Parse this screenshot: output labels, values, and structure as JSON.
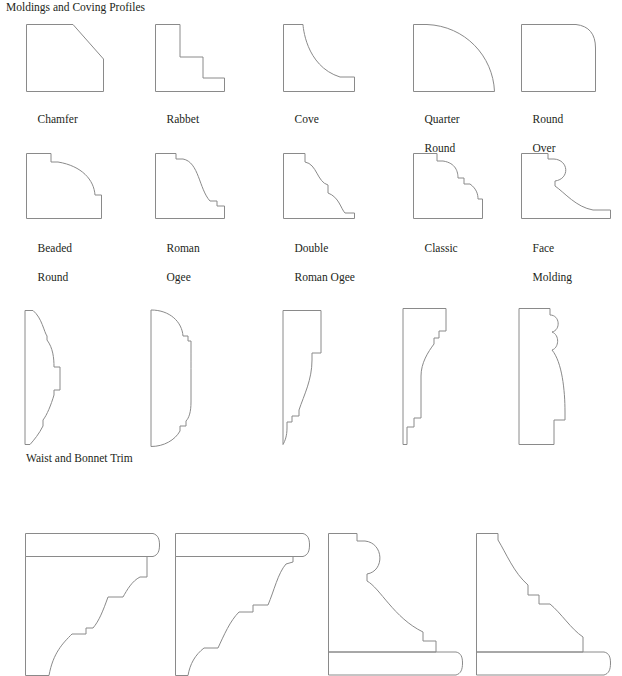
{
  "document": {
    "headings": [
      {
        "id": "title-main",
        "text": "Moldings and Coving Profiles"
      },
      {
        "id": "title-waist",
        "text": "Waist and Bonnet Trim"
      }
    ],
    "stroke_color": "#8a8a8a",
    "text_color": "#231f20",
    "background_color": "#ffffff"
  },
  "rows": {
    "row1": {
      "name": "molding-profiles-row-1",
      "items": [
        {
          "label_line1": "Chamfer",
          "label_line2": "",
          "shape": "chamfer"
        },
        {
          "label_line1": "Rabbet",
          "label_line2": "",
          "shape": "rabbet"
        },
        {
          "label_line1": "Cove",
          "label_line2": "",
          "shape": "cove"
        },
        {
          "label_line1": "Quarter",
          "label_line2": "Round",
          "shape": "quarter-round"
        },
        {
          "label_line1": "Round",
          "label_line2": "Over",
          "shape": "round-over"
        }
      ]
    },
    "row2": {
      "name": "molding-profiles-row-2",
      "items": [
        {
          "label_line1": "Beaded",
          "label_line2": "Round",
          "shape": "beaded-round"
        },
        {
          "label_line1": "Roman",
          "label_line2": "Ogee",
          "shape": "roman-ogee"
        },
        {
          "label_line1": "Double",
          "label_line2": "Roman Ogee",
          "shape": "double-roman-ogee"
        },
        {
          "label_line1": "Classic",
          "label_line2": "",
          "shape": "classic"
        },
        {
          "label_line1": "Face",
          "label_line2": "Molding",
          "shape": "face-molding"
        }
      ]
    },
    "row3": {
      "name": "waist-and-bonnet-trim-row",
      "items": [
        {
          "label_line1": "",
          "label_line2": "",
          "shape": "waist-trim-1"
        },
        {
          "label_line1": "",
          "label_line2": "",
          "shape": "waist-trim-2"
        },
        {
          "label_line1": "",
          "label_line2": "",
          "shape": "waist-trim-3"
        },
        {
          "label_line1": "",
          "label_line2": "",
          "shape": "waist-trim-4"
        },
        {
          "label_line1": "",
          "label_line2": "",
          "shape": "waist-trim-5"
        }
      ]
    },
    "row4": {
      "name": "crown-molding-row",
      "items": [
        {
          "label_line1": "",
          "label_line2": "",
          "shape": "crown-1"
        },
        {
          "label_line1": "",
          "label_line2": "",
          "shape": "crown-2"
        },
        {
          "label_line1": "",
          "label_line2": "",
          "shape": "crown-3"
        },
        {
          "label_line1": "",
          "label_line2": "",
          "shape": "crown-4"
        }
      ]
    }
  }
}
